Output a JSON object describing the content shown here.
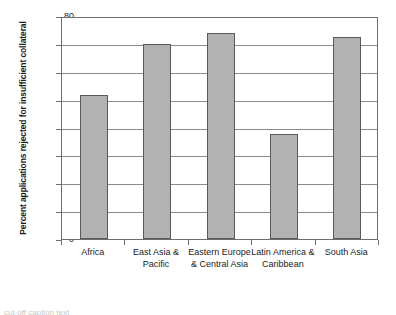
{
  "chart_data": {
    "type": "bar",
    "title": "",
    "xlabel": "",
    "ylabel": "Percent applications rejected for insufficient collateral",
    "categories": [
      "Africa",
      "East Asia & Pacific",
      "Eastern Europe & Central Asia",
      "Latin America & Caribbean",
      "South Asia"
    ],
    "values": [
      51.7,
      69.8,
      73.8,
      37.7,
      72.4
    ],
    "ylim": [
      0,
      80
    ],
    "ytick_labels": [
      "0",
      "10",
      "20",
      "30",
      "40",
      "50",
      "60",
      "70",
      "80"
    ],
    "ytick_values": [
      0,
      10,
      20,
      30,
      40,
      50,
      60,
      70,
      80
    ],
    "grid": "horizontal",
    "legend": "none",
    "bar_color": "#b2b2b2",
    "bar_edge_color": "#5a5a5a",
    "axis_color": "#6e6e6e",
    "gridline_color": "#8a8a8a",
    "background": "#ffffff"
  },
  "figure": {
    "caption_sliver": "cut-off caption text"
  }
}
